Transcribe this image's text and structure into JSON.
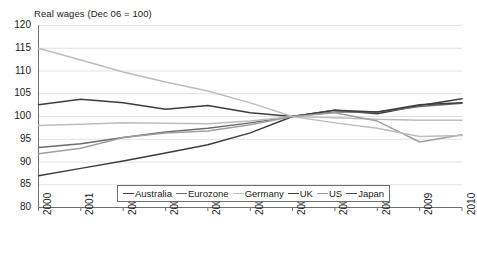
{
  "chart_data": {
    "type": "line",
    "title": "Real wages (Dec 06 = 100)",
    "xlabel": "",
    "ylabel": "",
    "x": [
      2000,
      2001,
      2002,
      2003,
      2004,
      2005,
      2006,
      2007,
      2008,
      2009,
      2010
    ],
    "categories": [
      "2000",
      "2001",
      "2002",
      "2003",
      "2004",
      "2005",
      "2006",
      "2007",
      "2008",
      "2009",
      "2010"
    ],
    "xlim": [
      2000,
      2010
    ],
    "ylim": [
      80,
      120
    ],
    "yticks": [
      80,
      85,
      90,
      95,
      100,
      105,
      110,
      115,
      120
    ],
    "grid": true,
    "legend_position": "bottom-center",
    "series": [
      {
        "name": "Australia",
        "color": "#3d3d3d",
        "values": [
          102.6,
          103.8,
          103.0,
          101.6,
          102.4,
          100.8,
          100.0,
          101.4,
          100.6,
          102.4,
          103.9
        ]
      },
      {
        "name": "Eurozone",
        "color": "#6b6b6b",
        "values": [
          93.2,
          94.0,
          95.4,
          96.6,
          97.4,
          98.6,
          100.0,
          101.0,
          101.0,
          102.2,
          102.9
        ]
      },
      {
        "name": "Germany",
        "color": "#bdbdbd",
        "values": [
          98.0,
          98.3,
          98.6,
          98.5,
          98.4,
          99.0,
          100.0,
          99.7,
          99.4,
          99.2,
          99.2
        ]
      },
      {
        "name": "UK",
        "color": "#3d3d3d",
        "values": [
          87.0,
          88.6,
          90.2,
          92.0,
          93.8,
          96.4,
          100.0,
          101.4,
          101.0,
          102.6,
          103.0
        ]
      },
      {
        "name": "US",
        "color": "#a0a0a0",
        "values": [
          91.8,
          93.0,
          95.4,
          96.4,
          96.8,
          98.2,
          100.0,
          100.8,
          99.0,
          94.4,
          96.0
        ]
      },
      {
        "name": "Japan",
        "color": "#bdbdbd",
        "values": [
          115.0,
          112.4,
          109.8,
          107.6,
          105.6,
          103.0,
          100.0,
          98.6,
          97.4,
          95.6,
          95.8
        ]
      }
    ]
  },
  "legend": {
    "items": [
      {
        "label": "Australia",
        "color": "#3d3d3d"
      },
      {
        "label": "Eurozone",
        "color": "#6b6b6b"
      },
      {
        "label": "Germany",
        "color": "#bdbdbd"
      },
      {
        "label": "UK",
        "color": "#3d3d3d"
      },
      {
        "label": "US",
        "color": "#a0a0a0"
      },
      {
        "label": "Japan",
        "color": "#4a4a4a"
      }
    ]
  },
  "axes": {
    "y_tick_labels": [
      "120",
      "115",
      "110",
      "105",
      "100",
      "95",
      "90",
      "85",
      "80"
    ],
    "x_tick_labels": [
      "2000",
      "2001",
      "2002",
      "2003",
      "2004",
      "2005",
      "2006",
      "2007",
      "2008",
      "2009",
      "2010"
    ]
  },
  "colors": {
    "axis": "#6e6e6e",
    "grid": "#e2e2e2",
    "text": "#1a1a1a",
    "background": "#ffffff"
  }
}
